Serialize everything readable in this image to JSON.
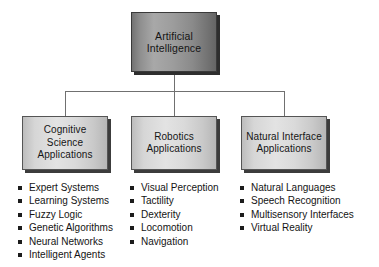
{
  "diagram": {
    "root": {
      "label": "Artificial Intelligence"
    },
    "branches": [
      {
        "id": "cognitive-science",
        "label": "Cognitive Science Applications",
        "items": [
          "Expert Systems",
          "Learning Systems",
          "Fuzzy Logic",
          "Genetic Algorithms",
          "Neural Networks",
          "Intelligent Agents"
        ]
      },
      {
        "id": "robotics",
        "label": "Robotics Applications",
        "items": [
          "Visual Perception",
          "Tactility",
          "Dexterity",
          "Locomotion",
          "Navigation"
        ]
      },
      {
        "id": "natural-interface",
        "label": "Natural Interface Applications",
        "items": [
          "Natural Languages",
          "Speech Recognition",
          "Multisensory Interfaces",
          "Virtual Reality"
        ]
      }
    ],
    "colors": {
      "background": "#ffffff",
      "root_fill_light": "#a8a8a8",
      "root_fill_dark": "#656565",
      "node_fill_light": "#e3e3e3",
      "node_fill_dark": "#b6b6b6",
      "border": "#4a4a4a",
      "shadow": "#2e2e2e",
      "connector": "#707070",
      "bullet": "#1c1c1c",
      "text": "#141414"
    }
  }
}
